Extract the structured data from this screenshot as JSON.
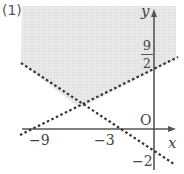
{
  "problem_label": "(1)",
  "axes": {
    "x_label": "x",
    "y_label": "y",
    "origin_label": "O"
  },
  "ticks": {
    "x_minus_9": "−9",
    "x_minus_3": "−3",
    "y_minus_2": "−2",
    "y_frac_num": "9",
    "y_frac_den": "2"
  },
  "lines": [
    {
      "name": "boundary-line-1",
      "style": "dashed",
      "x_intercept": -9,
      "y_intercept": 4.5
    },
    {
      "name": "boundary-line-2",
      "style": "dashed",
      "x_intercept": -3,
      "y_intercept": -2
    }
  ],
  "region": {
    "description": "shaded region above both dashed lines",
    "fill": "#e6e6e6"
  },
  "colors": {
    "axis": "#555555",
    "dash": "#333333",
    "shade": "#e6e6e6",
    "text": "#444444"
  }
}
